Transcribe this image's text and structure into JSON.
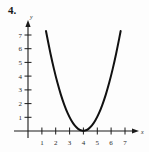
{
  "problem": {
    "number": "4."
  },
  "chart_data": {
    "type": "line",
    "title": "",
    "xlabel": "x",
    "ylabel": "y",
    "grid": false,
    "legend": false,
    "xlim": [
      0,
      7.6
    ],
    "ylim": [
      0,
      7.8
    ],
    "x_ticks": [
      1,
      2,
      3,
      4,
      5,
      6,
      7
    ],
    "y_ticks": [
      1,
      2,
      3,
      4,
      5,
      6,
      7
    ],
    "x_tick_labels": [
      "1",
      "2",
      "3",
      "4",
      "5",
      "6",
      "7"
    ],
    "y_tick_labels": [
      "1",
      "2",
      "3",
      "4",
      "5",
      "6",
      "7"
    ],
    "series": [
      {
        "name": "parabola",
        "equation": "y = (x - 4)^2",
        "vertex": [
          4,
          0
        ],
        "color": "#111111",
        "x": [
          1.3,
          1.5,
          1.75,
          2.0,
          2.25,
          2.5,
          2.75,
          3.0,
          3.25,
          3.5,
          3.75,
          4.0,
          4.25,
          4.5,
          4.75,
          5.0,
          5.25,
          5.5,
          5.75,
          6.0,
          6.25,
          6.5,
          6.7
        ],
        "values": [
          7.29,
          6.25,
          5.06,
          4.0,
          3.06,
          2.25,
          1.56,
          1.0,
          0.56,
          0.25,
          0.06,
          0.0,
          0.06,
          0.25,
          0.56,
          1.0,
          1.56,
          2.25,
          3.06,
          4.0,
          5.06,
          6.25,
          7.29
        ]
      }
    ]
  },
  "axes": {
    "x_axis_label": "x",
    "y_axis_label": "y"
  }
}
